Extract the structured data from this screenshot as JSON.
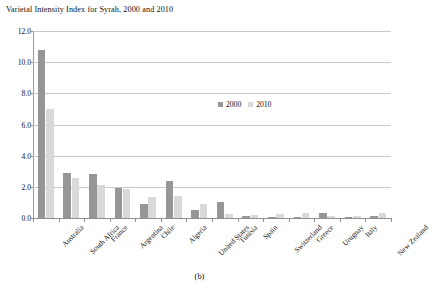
{
  "chart_data": {
    "type": "bar",
    "title": "Varietal Intensity Index for Syrah, 2000 and 2010",
    "xlabel": "",
    "ylabel": "",
    "ylim": [
      0.0,
      12.0
    ],
    "ytick_labels": [
      "0.0",
      "2.0",
      "4.0",
      "6.0",
      "8.0",
      "10.0",
      "12.0"
    ],
    "ytick_values": [
      0.0,
      2.0,
      4.0,
      6.0,
      8.0,
      10.0,
      12.0
    ],
    "grid": true,
    "legend_position": "center",
    "categories": [
      "Australia",
      "South Africa",
      "France",
      "Argentina",
      "Chile",
      "Algeria",
      "United States",
      "Tunisia",
      "Spain",
      "Switzerland",
      "Greece",
      "Uruguay",
      "Italy",
      "New Zealand"
    ],
    "series": [
      {
        "name": "2000",
        "color": "#969696",
        "values": [
          10.8,
          2.9,
          2.85,
          1.9,
          0.9,
          2.4,
          0.5,
          1.0,
          0.1,
          0.05,
          0.05,
          0.35,
          0.05,
          0.1
        ]
      },
      {
        "name": "2010",
        "color": "#d9d9d9",
        "values": [
          7.0,
          2.55,
          2.1,
          1.85,
          1.35,
          1.4,
          0.9,
          0.25,
          0.2,
          0.25,
          0.3,
          0.1,
          0.15,
          0.3
        ]
      }
    ]
  },
  "caption": "(b)"
}
